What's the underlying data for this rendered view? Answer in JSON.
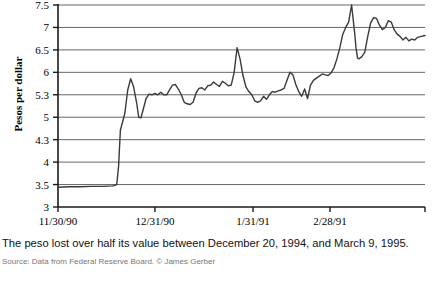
{
  "figure": {
    "caption": "The peso lost over half its value between December 20, 1994, and March 9, 1995.",
    "source": "Source: Data from Federal Reserve Board. © James Gerber"
  },
  "chart_data": {
    "type": "line",
    "title": "",
    "xlabel": "",
    "ylabel": "Pesos per dollar",
    "ylim": [
      3,
      7.5
    ],
    "grid": true,
    "legend": "none",
    "line_color": "#3a3a3a",
    "y_ticks": [
      "3",
      "3.5",
      "4",
      "4.3",
      "5",
      "5.3",
      "6",
      "6.5",
      "7",
      "7.5"
    ],
    "y_tick_values": [
      3,
      3.5,
      4,
      4.3,
      5,
      5.3,
      6,
      6.5,
      7,
      7.5
    ],
    "x_ticks": [
      "11/30/90",
      "12/31/90",
      "1/31/91",
      "2/28/91"
    ],
    "x_tick_positions": [
      0,
      0.2642,
      0.5314,
      0.7411
    ],
    "series": [
      {
        "name": "Pesos per dollar",
        "x": [
          0.0,
          0.03,
          0.06,
          0.09,
          0.12,
          0.15,
          0.16,
          0.165,
          0.17,
          0.176,
          0.182,
          0.19,
          0.198,
          0.206,
          0.214,
          0.22,
          0.226,
          0.232,
          0.24,
          0.248,
          0.256,
          0.264,
          0.272,
          0.28,
          0.288,
          0.296,
          0.304,
          0.312,
          0.32,
          0.328,
          0.336,
          0.344,
          0.352,
          0.36,
          0.368,
          0.376,
          0.384,
          0.392,
          0.4,
          0.408,
          0.416,
          0.424,
          0.432,
          0.44,
          0.448,
          0.456,
          0.464,
          0.472,
          0.48,
          0.488,
          0.496,
          0.504,
          0.512,
          0.52,
          0.528,
          0.536,
          0.544,
          0.552,
          0.56,
          0.568,
          0.576,
          0.584,
          0.592,
          0.6,
          0.608,
          0.616,
          0.624,
          0.632,
          0.64,
          0.648,
          0.656,
          0.664,
          0.672,
          0.68,
          0.688,
          0.696,
          0.704,
          0.712,
          0.72,
          0.728,
          0.736,
          0.744,
          0.752,
          0.76,
          0.768,
          0.776,
          0.784,
          0.792,
          0.8,
          0.808,
          0.812,
          0.816,
          0.82,
          0.828,
          0.836,
          0.844,
          0.852,
          0.86,
          0.868,
          0.876,
          0.884,
          0.892,
          0.9,
          0.908,
          0.916,
          0.924,
          0.932,
          0.94,
          0.948,
          0.956,
          0.964,
          0.972,
          0.98,
          0.99,
          1.0
        ],
        "values": [
          3.44,
          3.45,
          3.45,
          3.46,
          3.46,
          3.47,
          3.5,
          3.9,
          4.6,
          4.85,
          5.05,
          5.45,
          5.8,
          5.55,
          5.2,
          5.0,
          4.98,
          5.1,
          5.25,
          5.32,
          5.3,
          5.34,
          5.3,
          5.38,
          5.3,
          5.3,
          5.45,
          5.6,
          5.62,
          5.48,
          5.3,
          5.2,
          5.18,
          5.17,
          5.2,
          5.35,
          5.5,
          5.52,
          5.45,
          5.58,
          5.6,
          5.7,
          5.62,
          5.56,
          5.72,
          5.66,
          5.58,
          5.6,
          6.0,
          6.55,
          6.3,
          5.9,
          5.55,
          5.4,
          5.3,
          5.22,
          5.2,
          5.22,
          5.28,
          5.24,
          5.3,
          5.4,
          5.38,
          5.42,
          5.45,
          5.5,
          5.75,
          6.0,
          5.92,
          5.62,
          5.4,
          5.28,
          5.48,
          5.25,
          5.6,
          5.75,
          5.82,
          5.88,
          5.95,
          5.92,
          5.9,
          5.98,
          6.1,
          6.3,
          6.55,
          6.85,
          7.0,
          7.12,
          7.55,
          6.9,
          6.55,
          6.32,
          6.3,
          6.35,
          6.45,
          6.8,
          7.1,
          7.22,
          7.2,
          7.05,
          6.95,
          7.0,
          7.15,
          7.12,
          6.95,
          6.85,
          6.8,
          6.72,
          6.78,
          6.7,
          6.74,
          6.72,
          6.78,
          6.8,
          6.82
        ]
      }
    ]
  }
}
